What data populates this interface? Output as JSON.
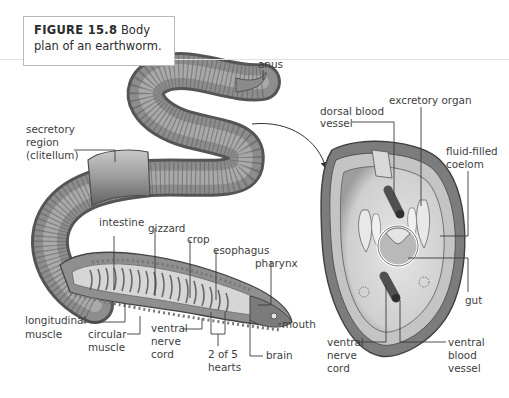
{
  "caption": {
    "figure_label": "FIGURE 15.8",
    "line1_rest": "Body",
    "line2": "plan of an earthworm."
  },
  "worm_labels": {
    "anus": "anus",
    "secretory_1": "secretory",
    "secretory_2": "region",
    "secretory_3": "(clitellum)",
    "intestine": "intestine",
    "gizzard": "gizzard",
    "crop": "crop",
    "esophagus": "esophagus",
    "pharynx": "pharynx",
    "longitudinal_1": "longitudinal",
    "longitudinal_2": "muscle",
    "circular_1": "circular",
    "circular_2": "muscle",
    "vnc_1": "ventral",
    "vnc_2": "nerve",
    "vnc_3": "cord",
    "hearts_1": "2 of 5",
    "hearts_2": "hearts",
    "mouth": "mouth",
    "brain": "brain"
  },
  "section_labels": {
    "dorsal_1": "dorsal blood",
    "dorsal_2": "vessel",
    "excretory": "excretory organ",
    "coelom_1": "fluid-filled",
    "coelom_2": "coelom",
    "gut": "gut",
    "vnc_1": "ventral",
    "vnc_2": "nerve",
    "vnc_3": "cord",
    "vbv_1": "ventral",
    "vbv_2": "blood",
    "vbv_3": "vessel"
  },
  "colors": {
    "worm_dark": "#5a5a5a",
    "worm_mid": "#8c8c8c",
    "worm_light": "#c4c4c4",
    "leader_line": "#3a3a3a",
    "caption_border": "#b9b9b9"
  }
}
